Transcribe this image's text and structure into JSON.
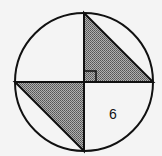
{
  "diagram": {
    "circle": {
      "cx": 84,
      "cy": 82,
      "r": 69
    },
    "center": [
      84,
      82
    ],
    "top": [
      84,
      13
    ],
    "right": [
      153,
      82
    ],
    "bottom": [
      84,
      151
    ],
    "left": [
      15,
      82
    ],
    "shaded_triangles": [
      {
        "name": "upper-right-triangle",
        "points": "84,13 84,82 153,82"
      },
      {
        "name": "lower-left-triangle",
        "points": "15,82 84,82 84,151"
      }
    ],
    "right_angle_marker": {
      "x": 85,
      "y": 71,
      "size": 11
    },
    "label": {
      "text": "6",
      "x": 113,
      "y": 119
    },
    "colors": {
      "stroke": "#111111",
      "shade": "#8a8a8a",
      "background": "#f4f4f4"
    }
  }
}
